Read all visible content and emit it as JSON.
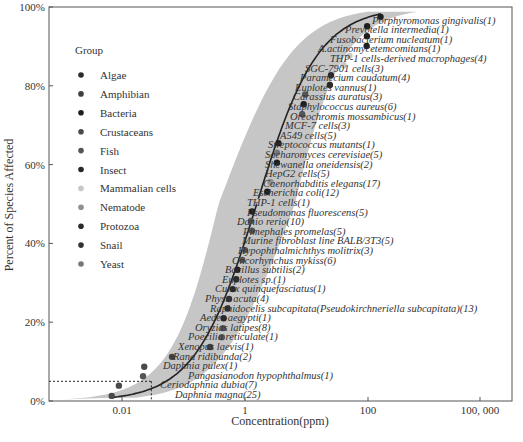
{
  "chart_data": {
    "type": "scatter",
    "title": "",
    "xlabel": "Concentration(ppm)",
    "ylabel": "Percent of Species Affected",
    "x_scale": "log",
    "x_ticks": [
      {
        "value": 0.01,
        "label": "0.01"
      },
      {
        "value": 1,
        "label": "1"
      },
      {
        "value": 100,
        "label": "100"
      },
      {
        "value": 100000,
        "label": "100, 000"
      }
    ],
    "y_ticks": [
      {
        "value": 0,
        "label": "0%"
      },
      {
        "value": 20,
        "label": "20%"
      },
      {
        "value": 40,
        "label": "40%"
      },
      {
        "value": 60,
        "label": "60%"
      },
      {
        "value": 80,
        "label": "80%"
      },
      {
        "value": 100,
        "label": "100%"
      }
    ],
    "xlim_log10": [
      -3.2,
      4.3
    ],
    "ylim": [
      0,
      100
    ],
    "grid": false,
    "legend": {
      "title": "Group",
      "position": "upper-left",
      "items": [
        {
          "label": "Algae",
          "color": "#2b2b2b"
        },
        {
          "label": "Amphibian",
          "color": "#3f3f3f"
        },
        {
          "label": "Bacteria",
          "color": "#1f1f1f"
        },
        {
          "label": "Crustaceans",
          "color": "#4a4a4a"
        },
        {
          "label": "Fish",
          "color": "#555555"
        },
        {
          "label": "Insect",
          "color": "#262626"
        },
        {
          "label": "Mammalian cells",
          "color": "#c8c8c8"
        },
        {
          "label": "Nematode",
          "color": "#8f8f8f"
        },
        {
          "label": "Protozoa",
          "color": "#2a2a2a"
        },
        {
          "label": "Snail",
          "color": "#333333"
        },
        {
          "label": "Yeast",
          "color": "#777777"
        }
      ]
    },
    "fitted_curve": {
      "description": "SSD fitted log-logistic curve",
      "color": "#222222"
    },
    "confidence_band": {
      "color": "#c6c6c6"
    },
    "hc5_reference": {
      "percent": 5,
      "concentration": 0.03,
      "style": "dotted"
    },
    "series": [
      {
        "name": "Daphnia magna(25)",
        "group": "Crustaceans",
        "conc": 0.0068,
        "percent": 1.3
      },
      {
        "name": "Ceriodaphnia dubia(7)",
        "group": "Crustaceans",
        "conc": 0.0089,
        "percent": 3.9
      },
      {
        "name": "Pangasianodon hypophthalmus(1)",
        "group": "Fish",
        "conc": 0.022,
        "percent": 6.3
      },
      {
        "name": "Daphnia pulex(1)",
        "group": "Crustaceans",
        "conc": 0.023,
        "percent": 8.7
      },
      {
        "name": "Rana ridibunda(2)",
        "group": "Amphibian",
        "conc": 0.065,
        "percent": 11.2
      },
      {
        "name": "Xenopus laevis(1)",
        "group": "Amphibian",
        "conc": 0.27,
        "percent": 13.7
      },
      {
        "name": "Poecilia reticulate(1)",
        "group": "Fish",
        "conc": 0.42,
        "percent": 16.2
      },
      {
        "name": "Oryzias latipes(8)",
        "group": "Fish",
        "conc": 0.44,
        "percent": 18.5
      },
      {
        "name": "Aedes aegypti(1)",
        "group": "Insect",
        "conc": 0.45,
        "percent": 21.0
      },
      {
        "name": "Raphidocelis subcapitata(Pseudokirchneriella subcapitata)(13)",
        "group": "Algae",
        "conc": 0.52,
        "percent": 23.5
      },
      {
        "name": "Physa acuta(4)",
        "group": "Snail",
        "conc": 0.55,
        "percent": 25.9
      },
      {
        "name": "Culex quinquefasciatus(1)",
        "group": "Insect",
        "conc": 0.63,
        "percent": 28.4
      },
      {
        "name": "Euplotes sp.(1)",
        "group": "Protozoa",
        "conc": 0.72,
        "percent": 30.9
      },
      {
        "name": "Bacillus subtilis(2)",
        "group": "Bacteria",
        "conc": 0.75,
        "percent": 33.3
      },
      {
        "name": "Oncorhynchus mykiss(6)",
        "group": "Fish",
        "conc": 0.9,
        "percent": 35.8
      },
      {
        "name": "Hypophthalmichthys molitrix(3)",
        "group": "Fish",
        "conc": 1.0,
        "percent": 38.3
      },
      {
        "name": "Murine fibroblast line BALB/3T3(5)",
        "group": "Mammalian cells",
        "conc": 1.2,
        "percent": 40.7
      },
      {
        "name": "Pimephales promelas(5)",
        "group": "Fish",
        "conc": 1.3,
        "percent": 43.2
      },
      {
        "name": "Danio rerio(10)",
        "group": "Fish",
        "conc": 1.25,
        "percent": 45.7
      },
      {
        "name": "Pseudomonas fluorescens(5)",
        "group": "Bacteria",
        "conc": 1.3,
        "percent": 48.1
      },
      {
        "name": "THP-1 cells(1)",
        "group": "Mammalian cells",
        "conc": 1.7,
        "percent": 50.6
      },
      {
        "name": "Escherichia coli(12)",
        "group": "Bacteria",
        "conc": 2.3,
        "percent": 53.1
      },
      {
        "name": "Caenorhabditis elegans(17)",
        "group": "Nematode",
        "conc": 2.6,
        "percent": 55.6
      },
      {
        "name": "HepG2 cells(5)",
        "group": "Mammalian cells",
        "conc": 3.1,
        "percent": 58.0
      },
      {
        "name": "Shewanella oneidensis(2)",
        "group": "Bacteria",
        "conc": 3.3,
        "percent": 60.5
      },
      {
        "name": "Sacharomyces cerevisiae(5)",
        "group": "Yeast",
        "conc": 3.3,
        "percent": 63.0
      },
      {
        "name": "Streptococcus mutants(1)",
        "group": "Bacteria",
        "conc": 3.5,
        "percent": 65.4
      },
      {
        "name": "A549 cells(5)",
        "group": "Mammalian cells",
        "conc": 6.5,
        "percent": 67.9
      },
      {
        "name": "MCF-7 cells(3)",
        "group": "Mammalian cells",
        "conc": 7.0,
        "percent": 70.4
      },
      {
        "name": "Oreochromis mossambicus(1)",
        "group": "Fish",
        "conc": 8.5,
        "percent": 72.8
      },
      {
        "name": "Staphylococcus aureus(6)",
        "group": "Bacteria",
        "conc": 9.0,
        "percent": 75.3
      },
      {
        "name": "Carassius auratus(3)",
        "group": "Fish",
        "conc": 9.5,
        "percent": 77.8
      },
      {
        "name": "Euplotes vannus(1)",
        "group": "Protozoa",
        "conc": 24,
        "percent": 80.2
      },
      {
        "name": "Paramecium caudatum(4)",
        "group": "Protozoa",
        "conc": 25,
        "percent": 82.7
      },
      {
        "name": "SGC-7901 cells(3)",
        "group": "Mammalian cells",
        "conc": 40,
        "percent": 85.2
      },
      {
        "name": "THP-1 cells-derived macrophages(4)",
        "group": "Mammalian cells",
        "conc": 50,
        "percent": 87.6
      },
      {
        "name": "A.actinomycetemcomitans(1)",
        "group": "Bacteria",
        "conc": 95,
        "percent": 90.1
      },
      {
        "name": "Fusobacterium nucleatum(1)",
        "group": "Bacteria",
        "conc": 96,
        "percent": 92.6
      },
      {
        "name": "Prevotella intermedia(1)",
        "group": "Bacteria",
        "conc": 97,
        "percent": 95.1
      },
      {
        "name": "Porphyromonas gingivalis(1)",
        "group": "Bacteria",
        "conc": 160,
        "percent": 97.5
      }
    ]
  },
  "axes": {
    "xlabel": "Concentration(ppm)",
    "ylabel": "Percent of Species Affected"
  },
  "legend": {
    "title": "Group"
  }
}
